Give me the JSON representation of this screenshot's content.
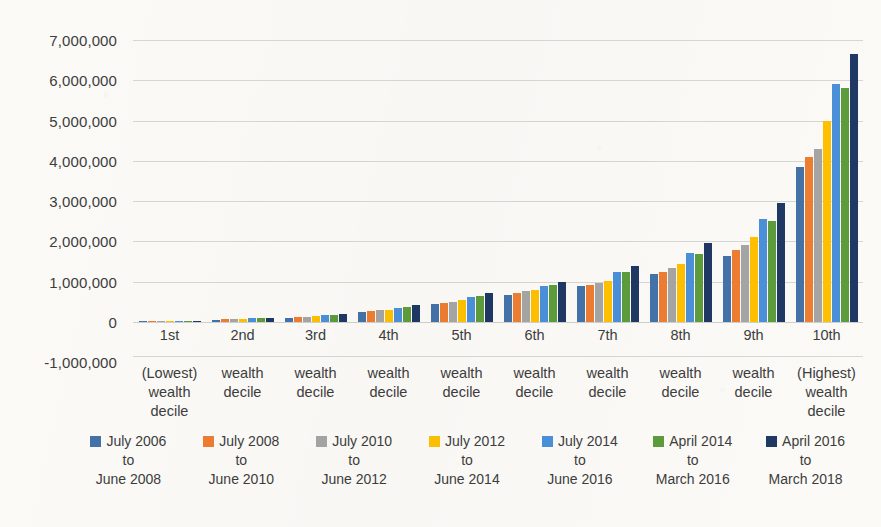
{
  "chart_data": {
    "type": "bar",
    "title": "",
    "xlabel": "",
    "ylabel": "",
    "ylim": [
      -1000000,
      7000000
    ],
    "grid": true,
    "legend_position": "bottom",
    "y_ticks": [
      "7,000,000",
      "6,000,000",
      "5,000,000",
      "4,000,000",
      "3,000,000",
      "2,000,000",
      "1,000,000",
      "0",
      "-1,000,000"
    ],
    "y_tick_values": [
      7000000,
      6000000,
      5000000,
      4000000,
      3000000,
      2000000,
      1000000,
      0,
      -1000000
    ],
    "categories": [
      {
        "rank": "1st",
        "sub": [
          "(Lowest)",
          "wealth",
          "decile"
        ]
      },
      {
        "rank": "2nd",
        "sub": [
          "wealth",
          "decile"
        ]
      },
      {
        "rank": "3rd",
        "sub": [
          "wealth",
          "decile"
        ]
      },
      {
        "rank": "4th",
        "sub": [
          "wealth",
          "decile"
        ]
      },
      {
        "rank": "5th",
        "sub": [
          "wealth",
          "decile"
        ]
      },
      {
        "rank": "6th",
        "sub": [
          "wealth",
          "decile"
        ]
      },
      {
        "rank": "7th",
        "sub": [
          "wealth",
          "decile"
        ]
      },
      {
        "rank": "8th",
        "sub": [
          "wealth",
          "decile"
        ]
      },
      {
        "rank": "9th",
        "sub": [
          "wealth",
          "decile"
        ]
      },
      {
        "rank": "10th",
        "sub": [
          "(Highest)",
          "wealth",
          "decile"
        ]
      }
    ],
    "series": [
      {
        "name": "July 2006 to June 2008",
        "label_lines": [
          "July 2006",
          "to",
          "June 2008"
        ],
        "color": "#4472a8",
        "values": [
          5000,
          60000,
          110000,
          250000,
          450000,
          660000,
          900000,
          1200000,
          1650000,
          3850000
        ]
      },
      {
        "name": "July 2008 to June 2010",
        "label_lines": [
          "July 2008",
          "to",
          "June 2010"
        ],
        "color": "#ed7d31",
        "values": [
          7000,
          70000,
          120000,
          270000,
          480000,
          720000,
          930000,
          1250000,
          1800000,
          4100000
        ]
      },
      {
        "name": "July 2010 to June 2012",
        "label_lines": [
          "July 2010",
          "to",
          "June 2012"
        ],
        "color": "#a5a5a5",
        "values": [
          8000,
          75000,
          130000,
          290000,
          500000,
          760000,
          980000,
          1350000,
          1900000,
          4300000
        ]
      },
      {
        "name": "July 2012 to June 2014",
        "label_lines": [
          "July 2012",
          "to",
          "June 2014"
        ],
        "color": "#ffc000",
        "values": [
          9000,
          80000,
          140000,
          310000,
          540000,
          800000,
          1020000,
          1450000,
          2100000,
          5000000
        ]
      },
      {
        "name": "July 2014 to June 2016",
        "label_lines": [
          "July 2014",
          "to",
          "June 2016"
        ],
        "color": "#4a90d9",
        "values": [
          10000,
          95000,
          170000,
          360000,
          620000,
          900000,
          1230000,
          1720000,
          2550000,
          5900000
        ]
      },
      {
        "name": "April 2014 to March 2016",
        "label_lines": [
          "April 2014",
          "to",
          "March 2016"
        ],
        "color": "#5d9c3c",
        "values": [
          10000,
          95000,
          175000,
          365000,
          640000,
          920000,
          1250000,
          1700000,
          2500000,
          5800000
        ]
      },
      {
        "name": "April 2016 to March 2018",
        "label_lines": [
          "April 2016",
          "to",
          "March 2018"
        ],
        "color": "#1f3864",
        "values": [
          12000,
          110000,
          200000,
          430000,
          720000,
          1000000,
          1400000,
          1970000,
          2950000,
          6650000
        ]
      }
    ]
  }
}
